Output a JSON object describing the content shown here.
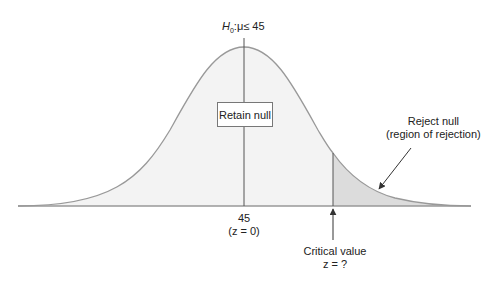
{
  "hypothesis": {
    "h_letter": "H",
    "h_sub": "0",
    "rest": ":μ≤ 45"
  },
  "retain_box": "Retain null",
  "reject": {
    "line1": "Reject null",
    "line2": "(region of rejection)"
  },
  "mean": {
    "value": "45",
    "z": "(z = 0)"
  },
  "critical": {
    "line1": "Critical value",
    "line2": "z = ?"
  },
  "colors": {
    "fill_retain": "#f3f3f3",
    "fill_reject": "#dcdcdc",
    "curve": "#999999",
    "lines": "#555555"
  }
}
